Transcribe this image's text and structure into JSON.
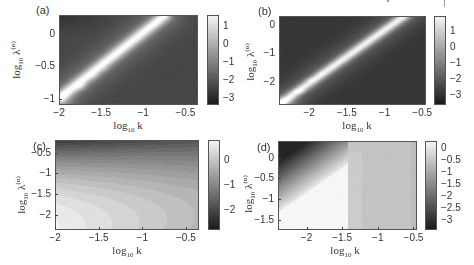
{
  "chart_data": [
    {
      "type": "heatmap",
      "panel_label": "(a)",
      "xlabel": "log10 k",
      "ylabel": "log10 λ(α)",
      "xlim": [
        -2.0,
        -0.35
      ],
      "ylim": [
        -1.1,
        0.3
      ],
      "xticks": [
        -2,
        -1.5,
        -1,
        -0.5
      ],
      "xtick_labels": [
        "−2",
        "−1.5",
        "−1",
        "−0.5"
      ],
      "yticks": [
        0,
        -0.5,
        -1
      ],
      "ytick_labels": [
        "0",
        "−0.5",
        "−1"
      ],
      "colorbar": {
        "range": [
          -3.4,
          1.6
        ],
        "ticks": [
          1,
          0,
          -1,
          -2,
          -3
        ],
        "tick_labels": [
          "1",
          "0",
          "−1",
          "−2",
          "−3"
        ]
      },
      "colormap": "gray",
      "description": "Bright diagonal ridge from lower-left (-2,-1) to upper-right (-0.75,0.3); dark in top-left and bottom-right corners",
      "ridge": {
        "from": [
          -2.0,
          -1.0
        ],
        "to": [
          -0.75,
          0.3
        ],
        "peak_value": 1.5
      }
    },
    {
      "type": "heatmap",
      "panel_label": "(b)",
      "xlabel": "log10 k",
      "ylabel": "log10 λ(α)",
      "xlim": [
        -2.4,
        -0.45
      ],
      "ylim": [
        -2.8,
        0.3
      ],
      "xticks": [
        -2,
        -1.5,
        -1,
        -0.5
      ],
      "xtick_labels": [
        "−2",
        "−1.5",
        "−1",
        "−0.5"
      ],
      "yticks": [
        0,
        -1,
        -2
      ],
      "ytick_labels": [
        "0",
        "−1",
        "−2"
      ],
      "colorbar": {
        "range": [
          -3.6,
          1.9
        ],
        "ticks": [
          1,
          0,
          -1,
          -2,
          -3
        ],
        "tick_labels": [
          "1",
          "0",
          "−1",
          "−2",
          "−3"
        ]
      },
      "colormap": "gray",
      "description": "Narrow bright diagonal ridge from lower-left (-2.4,-2.8) to upper-right (-0.75,0.3); mostly dark elsewhere",
      "ridge": {
        "from": [
          -2.4,
          -2.8
        ],
        "to": [
          -0.75,
          0.3
        ],
        "peak_value": 1.8
      }
    },
    {
      "type": "heatmap",
      "panel_label": "(c)",
      "xlabel": "log10 k",
      "ylabel": "log10 λ(α)",
      "xlim": [
        -2.0,
        -0.35
      ],
      "ylim": [
        -2.35,
        -0.2
      ],
      "xticks": [
        -2,
        -1.5,
        -1,
        -0.5
      ],
      "xtick_labels": [
        "−2",
        "−1.5",
        "−1",
        "−0.5"
      ],
      "yticks": [
        -0.5,
        -1,
        -1.5,
        -2
      ],
      "ytick_labels": [
        "−0.5",
        "−1",
        "−1.5",
        "−2"
      ],
      "colorbar": {
        "range": [
          -2.8,
          0.8
        ],
        "ticks": [
          0,
          -1,
          -2
        ],
        "tick_labels": [
          "0",
          "−1",
          "−2"
        ]
      },
      "colormap": "gray",
      "description": "Dark at top (high λ), brightest at bottom-left (low k, low λ), mid-gray toward right",
      "peak_value": 0.7
    },
    {
      "type": "heatmap",
      "panel_label": "(d)",
      "xlabel": "log10 k",
      "ylabel": "log10 λ(α)",
      "xlim": [
        -2.4,
        -0.45
      ],
      "ylim": [
        -1.75,
        0.4
      ],
      "xticks": [
        -2,
        -1.5,
        -1,
        -0.5
      ],
      "xtick_labels": [
        "−2",
        "−1.5",
        "−1",
        "−0.5"
      ],
      "yticks": [
        0,
        -0.5,
        -1,
        -1.5
      ],
      "ytick_labels": [
        "0",
        "−0.5",
        "−1",
        "−1.5"
      ],
      "colorbar": {
        "range": [
          -3.4,
          0.3
        ],
        "ticks": [
          0,
          -0.5,
          -1,
          -1.5,
          -2,
          -2.5,
          -3
        ],
        "tick_labels": [
          "0",
          "−0.5",
          "−1",
          "−1.5",
          "−2",
          "−2.5",
          "−3"
        ]
      },
      "colormap": "gray",
      "description": "Dark in top-left corner; bright white wedge in lower-left bounded near log10 k = -1.4; light-gray right region",
      "peak_value": 0.2
    }
  ]
}
